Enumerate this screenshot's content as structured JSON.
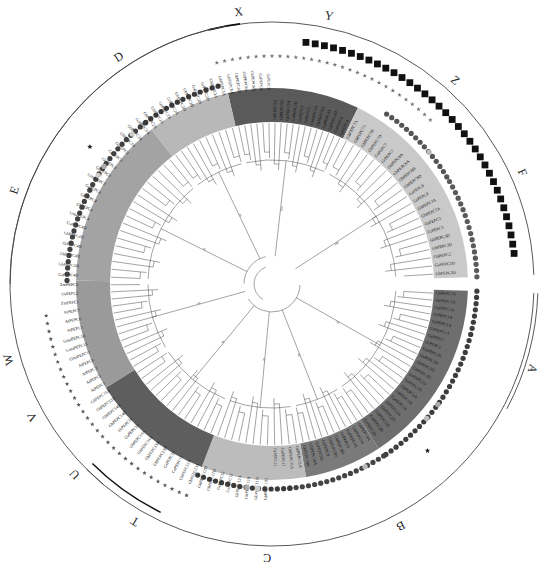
{
  "figure": {
    "type": "circular-phylogenetic-tree",
    "center": [
      272,
      284
    ],
    "outer_ring_radius": 262,
    "band_inner_radius": 162,
    "band_outer_radius": 196
  },
  "outer_clades": [
    {
      "label": "X",
      "start": -100,
      "end": -80,
      "label_angle": -97
    },
    {
      "label": "Y",
      "start": -80,
      "end": -55,
      "label_angle": -78
    },
    {
      "label": "Z",
      "start": -55,
      "end": -30,
      "label_angle": -48
    },
    {
      "label": "F",
      "start": -30,
      "end": -2,
      "label_angle": -24
    },
    {
      "label": "A",
      "start": 2,
      "end": 60,
      "label_angle": 18
    },
    {
      "label": "B",
      "start": 60,
      "end": 95,
      "label_angle": 62
    },
    {
      "label": "C",
      "start": 95,
      "end": 135,
      "label_angle": 91
    },
    {
      "label": "T",
      "start": 108,
      "end": 130,
      "label_angle": 120
    },
    {
      "label": "U",
      "start": 130,
      "end": 145,
      "label_angle": 136
    },
    {
      "label": "V",
      "start": 145,
      "end": 158,
      "label_angle": 151
    },
    {
      "label": "W",
      "start": 158,
      "end": 180,
      "label_angle": 164
    },
    {
      "label": "E",
      "start": 180,
      "end": 225,
      "label_angle": 200
    },
    {
      "label": "D",
      "start": 225,
      "end": 260,
      "label_angle": 236
    }
  ],
  "bands": [
    {
      "name": "X-Y",
      "start": -103,
      "end": -64,
      "color": "#5a5a5a"
    },
    {
      "name": "Z-F",
      "start": -64,
      "end": -2,
      "color": "#c9c9c9"
    },
    {
      "name": "A",
      "start": 2,
      "end": 57,
      "color": "#6e6e6e"
    },
    {
      "name": "B",
      "start": 57,
      "end": 80,
      "color": "#7a7a7a"
    },
    {
      "name": "C",
      "start": 80,
      "end": 111,
      "color": "#bcbcbc"
    },
    {
      "name": "T-U",
      "start": 111,
      "end": 148,
      "color": "#5e5e5e"
    },
    {
      "name": "W",
      "start": 148,
      "end": 181,
      "color": "#9a9a9a"
    },
    {
      "name": "E",
      "start": 181,
      "end": 232,
      "color": "#a3a3a3"
    },
    {
      "name": "D",
      "start": 232,
      "end": 257,
      "color": "#b8b8b8"
    }
  ],
  "leaf_labels": {
    "X-Y": [
      "GhPEPC6A",
      "GhPEPC6D",
      "GbPEPC6A",
      "GbPEPC6D",
      "GaPEPC6",
      "GrPEPC6",
      "GhPEPC5A",
      "GhPEPC5D",
      "GbPEPC5A",
      "GbPEPC5D",
      "GaPEPC5",
      "GrPEPC5",
      "GhPEPC4A",
      "GhPEPC4D",
      "GbPEPC4A",
      "GbPEPC4D",
      "GaPEPC4",
      "GrPEPC4"
    ],
    "Z-F": [
      "GhPEPC7A",
      "GbPEPC7A",
      "GhPEPC7D",
      "GbPEPC7D",
      "GaPEPC7",
      "GrPEPC7",
      "GhPEPC8A",
      "GbPEPC8A",
      "GhPEPC8D",
      "GbPEPC8D",
      "GaPEPC8",
      "GrPEPC8",
      "GhPEPC3A",
      "GbPEPC3A",
      "GaPEPC3",
      "GrPEPC3",
      "GhPEPC3D",
      "GbPEPC3D",
      "GhPEPC2",
      "GaPEPC2D",
      "GbPEPC2D"
    ],
    "A": [
      "GhPEPC1A",
      "GbPEPC1A",
      "GaPEPC1A",
      "GrPEPC1A",
      "GhPEPC1A",
      "GhPEPC1A",
      "GaPEPC1",
      "GrPEPC1",
      "GhPEPC1D",
      "GbPEPC1D",
      "GhPEPC1D",
      "GbPEPC1D",
      "GaPEPC1D",
      "GrPEPC1D",
      "GhPEPC2A",
      "GbPEPC2A",
      "GaPEPC2A",
      "GrPEPC2A",
      "GhPEPC2D",
      "GbPEPC2D",
      "GaPEPC2D",
      "GrPEPC2D"
    ],
    "B": [
      "GhPEPC9A",
      "GbPEPC9A",
      "GaPEPC9A",
      "GrPEPC9",
      "GhPEPC9D",
      "GbPEPC9D",
      "GaPEPC9",
      "GrPEPC9D",
      "GhPEPC10A",
      "GbPEPC10A"
    ],
    "C": [
      "GhPEPC11A",
      "GbPEPC11A",
      "GaPEPC11",
      "GrPEPC11",
      "GhPEPC11D",
      "GbPEPC11D",
      "GhPEPC12A",
      "GbPEPC12A",
      "GaPEPC12",
      "GrPEPC12",
      "GhPEPC12D",
      "GbPEPC12D"
    ],
    "T-U": [
      "GhPEPC13A",
      "GbPEPC13A",
      "GaPEPC13",
      "GrPEPC13",
      "GhPEPC13D",
      "GbPEPC13D",
      "GhPEPC14A",
      "GbPEPC14A",
      "GaPEPC14",
      "GrPEPC14",
      "GhPEPC14D",
      "GbPEPC14D",
      "GhPEPC15A",
      "GbPEPC15A"
    ],
    "W": [
      "AtPEPC1",
      "AtPEPC2",
      "AtPEPC3",
      "AtPEPC4",
      "GmaPEPC11",
      "GmaPEPC13",
      "GmaPEPC14",
      "AtPEPC5",
      "AtPEPC6",
      "AtPEPC7",
      "ZmPEPC1",
      "OsPEPC2",
      "ZmPEPC3"
    ],
    "E": [
      "GaPEPC4D",
      "GbPEPC4D",
      "GhPEPC4D",
      "GrPEPC4D",
      "GhPEPC4D",
      "GaPEPC4D",
      "GmaPEPC4",
      "GhPEPC4",
      "GbPEPC4",
      "GaPEPC4",
      "GmaPEPC3",
      "GhPEPC3",
      "GbPEPC3",
      "GaPEPC3",
      "GrPEPC3",
      "GhPEPC3A",
      "GbPEPC3A",
      "GaPEPC3A"
    ],
    "D": [
      "GhPEPC2A",
      "GbPEPC2A",
      "GaPEPC2A",
      "GrPEPC2A",
      "GhPEPC2D",
      "GbPEPC2D",
      "GaPEPC2D",
      "GrPEPC2D",
      "GhPEPC1A",
      "GbPEPC1A"
    ]
  },
  "marker_rings": [
    {
      "name": "circles-inner",
      "shape": "circle",
      "radius": 205,
      "size": 2.6,
      "segments": [
        {
          "start": -56,
          "end": -30,
          "color": "#555555"
        },
        {
          "start": -30,
          "end": -2,
          "color": "#5a5a5a"
        },
        {
          "start": 2,
          "end": 57,
          "color": "#3d3d3d"
        },
        {
          "start": 57,
          "end": 85,
          "color": "#444444"
        },
        {
          "start": 85,
          "end": 112,
          "color": "#3a3a3a"
        },
        {
          "start": 181,
          "end": 232,
          "color": "#404040"
        },
        {
          "start": 232,
          "end": 256,
          "color": "#383838"
        }
      ]
    },
    {
      "name": "stars-middle",
      "shape": "star",
      "radius": 228,
      "size": 1.8,
      "segments": [
        {
          "start": -104,
          "end": -46,
          "color": "#777777"
        },
        {
          "start": 112,
          "end": 172,
          "color": "#555555"
        }
      ]
    },
    {
      "name": "squares-outer",
      "shape": "square",
      "radius": 244,
      "size": 3.4,
      "segments": [
        {
          "start": -82,
          "end": -6,
          "color": "#111111"
        }
      ]
    }
  ],
  "light_markers": [
    {
      "ring": 205,
      "angle": -40,
      "color": "#bbbbbb"
    },
    {
      "ring": 205,
      "angle": 36,
      "color": "#aaaaaa"
    },
    {
      "ring": 205,
      "angle": 41,
      "color": "#bbbbbb"
    },
    {
      "ring": 205,
      "angle": 63,
      "color": "#bbbbbb"
    },
    {
      "ring": 205,
      "angle": 94,
      "color": "#cccccc"
    },
    {
      "ring": 205,
      "angle": 97,
      "color": "#aaaaaa"
    },
    {
      "ring": 205,
      "angle": 212,
      "color": "#cccccc"
    },
    {
      "ring": 205,
      "angle": 215,
      "color": "#aaaaaa"
    },
    {
      "ring": 205,
      "angle": 227,
      "color": "#cccccc"
    }
  ],
  "special_markers": [
    {
      "angle": 47,
      "radius": 228,
      "symbol": "star",
      "color": "#222222"
    },
    {
      "angle": 217,
      "radius": 228,
      "symbol": "star",
      "color": "#222222"
    }
  ],
  "bootstrap_values": [
    "100",
    "100",
    "99",
    "98",
    "97",
    "96",
    "95",
    "94",
    "92",
    "90",
    "88",
    "85",
    "80",
    "76",
    "72",
    "68",
    "65",
    "60",
    "55",
    "52"
  ],
  "colors": {
    "branch": "#333333",
    "outer_ring": "#444444",
    "outer_ring_accent": "#111111",
    "background": "#ffffff"
  }
}
